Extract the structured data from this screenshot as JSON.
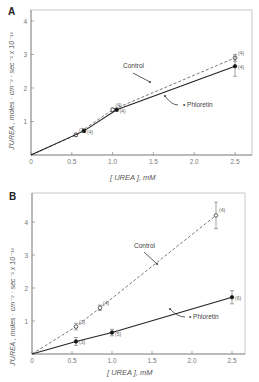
{
  "figure": {
    "panels": [
      {
        "letter": "A",
        "ylabel": "J'UREA , moles · cm⁻² · sec⁻¹ x 10⁻¹²",
        "xlabel": "[ UREA ], mM",
        "control_label": "Control",
        "phloretin_label": "• Phloretin"
      },
      {
        "letter": "B",
        "ylabel": "J'UREA , moles · cm⁻² · sec⁻¹ x 10⁻¹²",
        "xlabel": "[ UREA ], mM",
        "control_label": "Control",
        "phloretin_label": "• Phloretin"
      }
    ]
  },
  "chart_data": [
    {
      "type": "line",
      "title": "A",
      "xlabel": "[UREA], mM",
      "ylabel": "J'UREA, moles·cm^-2·sec^-1 x 10^-12",
      "xlim": [
        0,
        2.7
      ],
      "ylim": [
        0,
        4.4
      ],
      "xticks": [
        "0",
        "0.5",
        "1.0",
        "1.5",
        "2.0",
        "2.5"
      ],
      "yticks": [
        "1",
        "2",
        "3",
        "4"
      ],
      "grid": false,
      "series": [
        {
          "name": "Control",
          "style": "dashed, open circles",
          "x": [
            0,
            0.55,
            1.0,
            2.5
          ],
          "y": [
            0,
            0.6,
            1.35,
            2.9
          ],
          "n_labels": [
            "",
            "(7)",
            "(4)",
            "(4)"
          ],
          "error_bars": [
            0,
            0.05,
            0.05,
            0.1
          ]
        },
        {
          "name": "Phloretin",
          "style": "solid, filled circles",
          "x": [
            0,
            0.65,
            1.05,
            2.5
          ],
          "y": [
            0,
            0.72,
            1.35,
            2.65
          ],
          "n_labels": [
            "",
            "(4)",
            "(4)",
            "(4)"
          ],
          "error_bars": [
            0,
            0.05,
            0.05,
            0.3
          ]
        }
      ]
    },
    {
      "type": "line",
      "title": "B",
      "xlabel": "[UREA], mM",
      "ylabel": "J'UREA, moles·cm^-2·sec^-1 x 10^-12",
      "xlim": [
        0,
        2.7
      ],
      "ylim": [
        0,
        5
      ],
      "xticks": [
        "0",
        "0.5",
        "1.0",
        "1.5",
        "2.0",
        "2.5"
      ],
      "yticks": [
        "1",
        "2",
        "3",
        "4"
      ],
      "grid": false,
      "series": [
        {
          "name": "Control",
          "style": "dashed, open circles",
          "x": [
            0,
            0.55,
            0.85,
            2.3
          ],
          "y": [
            0,
            0.83,
            1.4,
            4.2
          ],
          "n_labels": [
            "",
            "(3)",
            "(4)",
            "(4)"
          ],
          "error_bars": [
            0,
            0.1,
            0.08,
            0.4
          ]
        },
        {
          "name": "Phloretin",
          "style": "solid, filled circles",
          "x": [
            0,
            0.55,
            1.0,
            2.5
          ],
          "y": [
            0,
            0.38,
            0.65,
            1.72
          ],
          "n_labels": [
            "",
            "(3)",
            "(5)",
            "(6)"
          ],
          "error_bars": [
            0,
            0.12,
            0.1,
            0.2
          ]
        }
      ]
    }
  ]
}
